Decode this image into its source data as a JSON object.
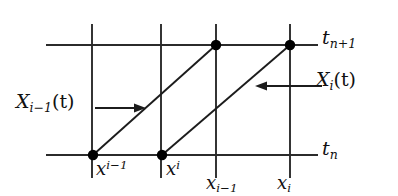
{
  "figure": {
    "background_color": "#ffffff",
    "line_color": "#2b2b2b",
    "dot_color": "#000000"
  },
  "labels": {
    "t_np1": {
      "base": "t",
      "sub": "n+1"
    },
    "t_n": {
      "base": "t",
      "sub": "n"
    },
    "X_i_t": {
      "base": "X",
      "sub": "i",
      "arg": "(t)"
    },
    "X_im1_t": {
      "base": "X",
      "sub": "i−1",
      "arg": "(t)"
    },
    "x_sup_im1": {
      "base": "x",
      "sup": "i−1"
    },
    "x_sup_i": {
      "base": "x",
      "sup": "i"
    },
    "x_sub_im1": {
      "base": "x",
      "sub": "i−1"
    },
    "x_sub_i": {
      "base": "x",
      "sub": "i"
    }
  },
  "geometry": {
    "horizontal_lines": [
      {
        "name": "t_n+1 level",
        "x1": 46,
        "y1": 45,
        "x2": 318,
        "y2": 45
      },
      {
        "name": "t_n level",
        "x1": 46,
        "y1": 155,
        "x2": 318,
        "y2": 155
      }
    ],
    "vertical_lines": [
      {
        "name": "grid-line-1",
        "x": 92,
        "y1": 24,
        "y2": 178
      },
      {
        "name": "grid-line-2",
        "x": 161,
        "y1": 24,
        "y2": 178
      },
      {
        "name": "grid-line-3",
        "x": 216,
        "y1": 24,
        "y2": 178
      },
      {
        "name": "grid-line-4",
        "x": 290,
        "y1": 24,
        "y2": 178
      }
    ],
    "characteristics": [
      {
        "name": "X_{i-1}(t)",
        "x1": 93,
        "y1": 155,
        "x2": 216,
        "y2": 45
      },
      {
        "name": "X_i(t)",
        "x1": 162,
        "y1": 155,
        "x2": 290,
        "y2": 45
      }
    ],
    "points": [
      {
        "name": "x^{i-1} at t_n",
        "x": 93,
        "y": 155
      },
      {
        "name": "x^{i} at t_n",
        "x": 162,
        "y": 155
      },
      {
        "name": "x_{i-1} at t_{n+1}",
        "x": 216,
        "y": 45
      },
      {
        "name": "x_{i} at t_{n+1}",
        "x": 290,
        "y": 45
      }
    ],
    "arrows": [
      {
        "name": "arrow-to-X_{i-1}",
        "x1": 95,
        "y1": 108,
        "x2": 143,
        "y2": 108,
        "direction": "right"
      },
      {
        "name": "arrow-to-X_i",
        "x1": 322,
        "y1": 86,
        "x2": 256,
        "y2": 86,
        "direction": "left"
      }
    ]
  }
}
